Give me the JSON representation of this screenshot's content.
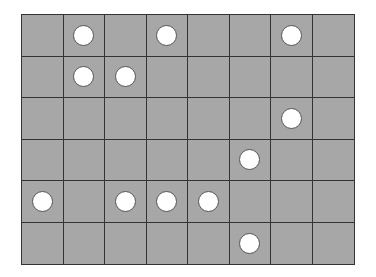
{
  "board": {
    "rows": 6,
    "cols": 8,
    "cell_color": "#a7a7a7",
    "line_color": "#333333",
    "token_color": "#ffffff",
    "grid": [
      [
        0,
        1,
        0,
        1,
        0,
        0,
        1,
        0
      ],
      [
        0,
        1,
        1,
        0,
        0,
        0,
        0,
        0
      ],
      [
        0,
        0,
        0,
        0,
        0,
        0,
        1,
        0
      ],
      [
        0,
        0,
        0,
        0,
        0,
        1,
        0,
        0
      ],
      [
        1,
        0,
        1,
        1,
        1,
        0,
        0,
        0
      ],
      [
        0,
        0,
        0,
        0,
        0,
        1,
        0,
        0
      ]
    ],
    "tokens": [
      {
        "row": 0,
        "col": 1
      },
      {
        "row": 0,
        "col": 3
      },
      {
        "row": 0,
        "col": 6
      },
      {
        "row": 1,
        "col": 1
      },
      {
        "row": 1,
        "col": 2
      },
      {
        "row": 2,
        "col": 6
      },
      {
        "row": 3,
        "col": 5
      },
      {
        "row": 4,
        "col": 0
      },
      {
        "row": 4,
        "col": 2
      },
      {
        "row": 4,
        "col": 3
      },
      {
        "row": 4,
        "col": 4
      },
      {
        "row": 5,
        "col": 5
      }
    ],
    "token_count": 12
  }
}
